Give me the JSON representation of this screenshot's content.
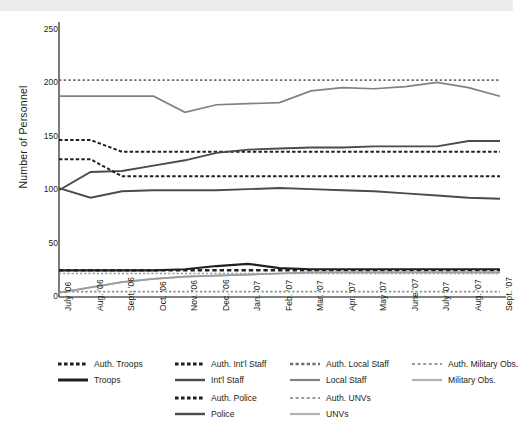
{
  "chart_data": {
    "type": "line",
    "title": "",
    "xlabel": "",
    "ylabel": "Number of Personnel",
    "ylim": [
      0,
      250
    ],
    "yticks": [
      0,
      50,
      100,
      150,
      200,
      250
    ],
    "grid": false,
    "legend_position": "bottom",
    "categories": [
      "July '06",
      "Aug. '06",
      "Sept. '06",
      "Oct. '06",
      "Nov. '06",
      "Dec. '06",
      "Jan. '07",
      "Feb. '07",
      "Mar. '07",
      "Apr. '07",
      "May '07",
      "June '07",
      "July '07",
      "Aug. '07",
      "Sept. '07"
    ],
    "series": [
      {
        "name": "Auth. Troops",
        "style": "dashed",
        "color": "#231f20",
        "width": 2.6,
        "values": [
          25,
          25,
          25,
          25,
          25,
          25,
          25,
          25,
          25,
          25,
          25,
          25,
          25,
          25,
          25
        ]
      },
      {
        "name": "Auth. Int'l Staff",
        "style": "dashed",
        "color": "#231f20",
        "width": 2.0,
        "values": [
          147,
          147,
          136,
          136,
          136,
          136,
          136,
          136,
          136,
          136,
          136,
          136,
          136,
          136,
          136
        ]
      },
      {
        "name": "Auth. Local Staff",
        "style": "dotted",
        "color": "#6d6e71",
        "width": 1.8,
        "values": [
          203,
          203,
          203,
          203,
          203,
          203,
          203,
          203,
          203,
          203,
          203,
          203,
          203,
          203,
          203
        ]
      },
      {
        "name": "Auth. Military Obs.",
        "style": "dotted",
        "color": "#9a9b9d",
        "width": 1.6,
        "values": [
          22,
          22,
          22,
          22,
          22,
          22,
          22,
          22,
          22,
          22,
          22,
          22,
          22,
          22,
          22
        ]
      },
      {
        "name": "Troops",
        "style": "solid",
        "color": "#231f20",
        "width": 2.2,
        "values": [
          25,
          25,
          25,
          25,
          26,
          29,
          31,
          27,
          26,
          26,
          26,
          26,
          26,
          26,
          26
        ]
      },
      {
        "name": "Int'l Staff",
        "style": "solid",
        "color": "#4a4b4d",
        "width": 1.9,
        "values": [
          100,
          117,
          118,
          123,
          128,
          135,
          138,
          139,
          140,
          140,
          141,
          141,
          141,
          146,
          146
        ]
      },
      {
        "name": "Local Staff",
        "style": "solid",
        "color": "#808183",
        "width": 1.7,
        "values": [
          188,
          188,
          188,
          188,
          173,
          180,
          181,
          182,
          193,
          196,
          195,
          197,
          201,
          196,
          188
        ]
      },
      {
        "name": "Military Obs.",
        "style": "solid",
        "color": "#b0b1b3",
        "width": 1.7,
        "values": [
          4,
          9,
          14,
          17,
          19,
          20,
          21,
          22,
          23,
          23,
          23,
          23,
          23,
          23,
          23
        ]
      },
      {
        "name": "Auth. Police",
        "style": "dashed",
        "color": "#231f20",
        "width": 2.0,
        "values": [
          129,
          129,
          113,
          113,
          113,
          113,
          113,
          113,
          113,
          113,
          113,
          113,
          113,
          113,
          113
        ]
      },
      {
        "name": "Auth. UNVs",
        "style": "dotted",
        "color": "#8e8f91",
        "width": 1.7,
        "values": [
          5,
          5,
          5,
          5,
          5,
          5,
          5,
          5,
          5,
          5,
          5,
          5,
          5,
          5,
          5
        ]
      },
      {
        "name": "Police",
        "style": "solid",
        "color": "#4a4b4d",
        "width": 1.9,
        "values": [
          102,
          93,
          99,
          100,
          100,
          100,
          101,
          102,
          101,
          100,
          99,
          97,
          95,
          93,
          92
        ]
      },
      {
        "name": "UNVs",
        "style": "solid",
        "color": "#9a9b9d",
        "width": 1.7,
        "values": [
          4,
          9,
          14,
          17,
          19,
          20,
          21,
          22,
          23,
          23,
          23,
          23,
          23,
          23,
          23
        ]
      }
    ]
  },
  "legend": {
    "rows": [
      [
        {
          "label": "Auth. Troops",
          "swatch": "dashed-heavy-dark"
        },
        {
          "label": "Auth. Int'l  Staff",
          "swatch": "dashed-heavy-dark"
        },
        {
          "label": "Auth. Local Staff",
          "swatch": "dashed-mid"
        },
        {
          "label": "Auth. Military Obs.",
          "swatch": "dashed-light"
        }
      ],
      [
        {
          "label": "Troops",
          "swatch": "solid-heavy-dark"
        },
        {
          "label": "Int'l Staff",
          "swatch": "solid-dark"
        },
        {
          "label": "Local Staff",
          "swatch": "solid-mid"
        },
        {
          "label": "Military Obs.",
          "swatch": "solid-light"
        }
      ],
      [
        {
          "label": "Auth. Police",
          "swatch": "dashed-heavy-dark"
        },
        {
          "label": "Auth. UNVs",
          "swatch": "dashed-light"
        }
      ],
      [
        {
          "label": "Police",
          "swatch": "solid-dark"
        },
        {
          "label": "UNVs",
          "swatch": "solid-light"
        }
      ]
    ]
  },
  "colors": {
    "axis": "#58595b",
    "text": "#231f20",
    "band": "#ececec",
    "background": "#ffffff"
  }
}
